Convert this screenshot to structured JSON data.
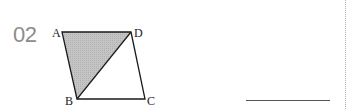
{
  "problem": {
    "number": "02"
  },
  "figure": {
    "shape": "parallelogram ABCD with diagonal BD; triangle ABD shaded",
    "vertices": {
      "A": {
        "label": "A",
        "x": 62,
        "y": 32
      },
      "B": {
        "label": "B",
        "x": 77,
        "y": 99
      },
      "C": {
        "label": "C",
        "x": 145,
        "y": 99
      },
      "D": {
        "label": "D",
        "x": 131,
        "y": 32
      }
    },
    "shaded_region": "triangle ABD",
    "colors": {
      "stroke": "#1a1a1a",
      "shade": "#bdbdbd"
    }
  },
  "answer": {
    "blank": ""
  }
}
